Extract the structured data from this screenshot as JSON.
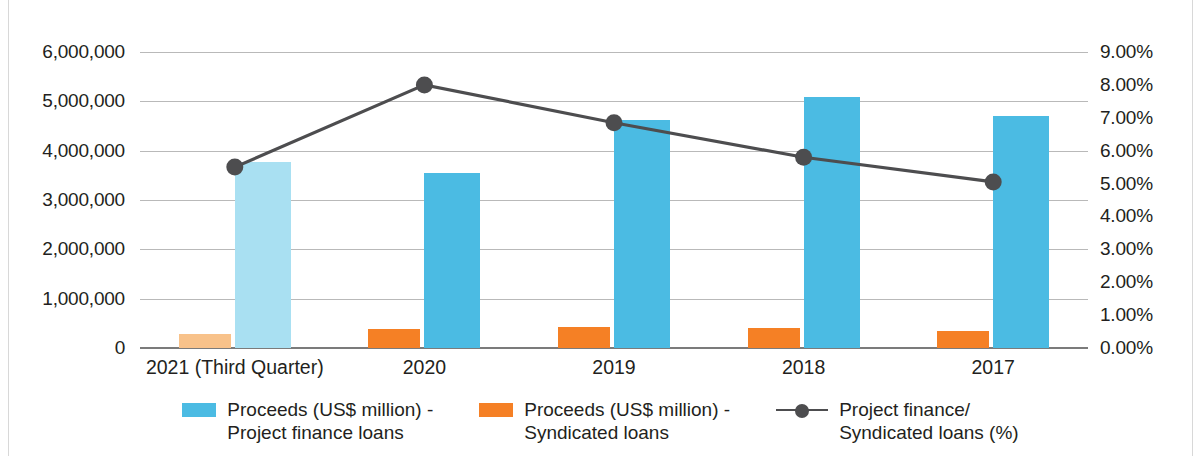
{
  "chart_data": {
    "type": "bar",
    "title": "",
    "xlabel": "",
    "ylabel": "",
    "grid": true,
    "legend_position": "bottom",
    "categories": [
      "2021 (Third Quarter)",
      "2020",
      "2019",
      "2018",
      "2017"
    ],
    "y_left": {
      "label": "",
      "ticks": [
        "0",
        "1,000,000",
        "2,000,000",
        "3,000,000",
        "4,000,000",
        "5,000,000",
        "6,000,000"
      ],
      "tick_values": [
        0,
        1000000,
        2000000,
        3000000,
        4000000,
        5000000,
        6000000
      ],
      "ylim": [
        0,
        6000000
      ]
    },
    "y_right": {
      "label": "",
      "ticks": [
        "0.00%",
        "1.00%",
        "2.00%",
        "3.00%",
        "4.00%",
        "5.00%",
        "6.00%",
        "7.00%",
        "8.00%",
        "9.00%"
      ],
      "tick_values": [
        0,
        1,
        2,
        3,
        4,
        5,
        6,
        7,
        8,
        9
      ],
      "ylim": [
        0,
        9
      ]
    },
    "series": [
      {
        "name": "Proceeds (US$ million) -\nProject finance loans",
        "type": "bar",
        "axis": "left",
        "color": "#4bbbe3",
        "values": [
          3780000,
          3540000,
          4630000,
          5080000,
          4700000
        ]
      },
      {
        "name": "Proceeds (US$ million) -\nSyndicated loans",
        "type": "bar",
        "axis": "left",
        "color": "#f58025",
        "values": [
          290000,
          380000,
          420000,
          400000,
          340000
        ]
      },
      {
        "name": "Project finance/\nSyndicated loans (%)",
        "type": "line",
        "axis": "right",
        "color": "#4d4d4f",
        "values": [
          5.5,
          8.0,
          6.85,
          5.8,
          5.05
        ]
      }
    ]
  },
  "legend": {
    "items": [
      {
        "label": "Proceeds (US$ million) -\nProject finance loans",
        "symbol": "square",
        "color": "#4bbbe3"
      },
      {
        "label": "Proceeds (US$ million) -\nSyndicated loans",
        "symbol": "square",
        "color": "#f58025"
      },
      {
        "label": "Project finance/\nSyndicated loans (%)",
        "symbol": "line-marker",
        "color": "#4d4d4f"
      }
    ]
  }
}
